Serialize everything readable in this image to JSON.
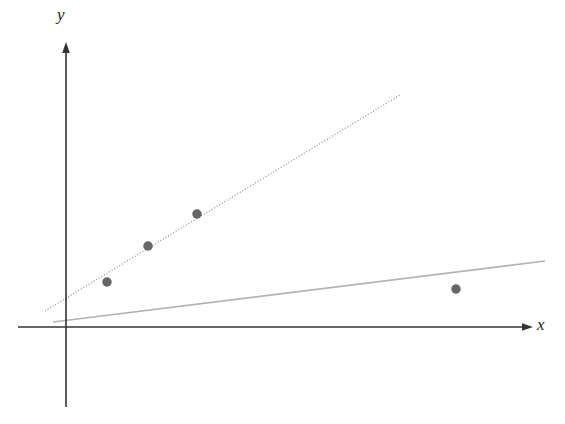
{
  "figure": {
    "background_color": "#ffffff",
    "width": 565,
    "height": 424,
    "y_axis_label": "y",
    "x_axis_label": "x"
  },
  "chart_data": {
    "type": "scatter",
    "title": "",
    "subtitle": "",
    "xlabel": "x",
    "ylabel": "y",
    "grid": false,
    "legend_position": "none",
    "axis_style": "arrow-terminated cartesian axes through origin, no tick marks, no tick labels",
    "xlim": [
      0,
      10
    ],
    "ylim": [
      0,
      10
    ],
    "origin_px": {
      "x": 66,
      "y": 327
    },
    "axes": [
      {
        "name": "y-axis",
        "orientation": "vertical",
        "color": "#333333",
        "width_px": 1.6,
        "arrow": "up",
        "from_px": {
          "x": 66,
          "y": 407
        },
        "to_px": {
          "x": 66,
          "y": 42
        }
      },
      {
        "name": "x-axis",
        "orientation": "horizontal",
        "color": "#333333",
        "width_px": 1.4,
        "arrow": "right",
        "from_px": {
          "x": 18,
          "y": 327
        },
        "to_px": {
          "x": 533,
          "y": 327
        }
      }
    ],
    "points": [
      {
        "label": "point-1",
        "x": 0.95,
        "y": 1.0,
        "px": {
          "x": 107,
          "y": 282
        }
      },
      {
        "label": "point-2",
        "x": 1.85,
        "y": 1.8,
        "px": {
          "x": 148,
          "y": 246
        }
      },
      {
        "label": "point-3",
        "x": 2.95,
        "y": 2.5,
        "px": {
          "x": 197,
          "y": 214
        }
      },
      {
        "label": "point-4",
        "x": 8.85,
        "y": 0.85,
        "px": {
          "x": 456,
          "y": 289
        }
      }
    ],
    "point_style": {
      "marker": "filled-circle",
      "color": "#666666",
      "diameter_px": 9.5
    },
    "series": [
      {
        "name": "dotted-regression-line",
        "type": "line",
        "style": "dotted",
        "color": "#8c8c8c",
        "width_px": 1.2,
        "dash_pattern": "1 2",
        "from_px": {
          "x": 45,
          "y": 311
        },
        "to_px": {
          "x": 400,
          "y": 95
        },
        "slope_px_per_px": -0.608,
        "description": "steep dotted line passing through the three left-hand points"
      },
      {
        "name": "solid-regression-line",
        "type": "line",
        "style": "solid",
        "color": "#b3b3b3",
        "width_px": 1.6,
        "from_px": {
          "x": 53,
          "y": 322
        },
        "to_px": {
          "x": 545,
          "y": 261
        },
        "slope_px_per_px": -0.124,
        "description": "shallow solid grey line drawn across the full width, pulled down by the outlying right-hand point"
      }
    ],
    "annotations": []
  }
}
